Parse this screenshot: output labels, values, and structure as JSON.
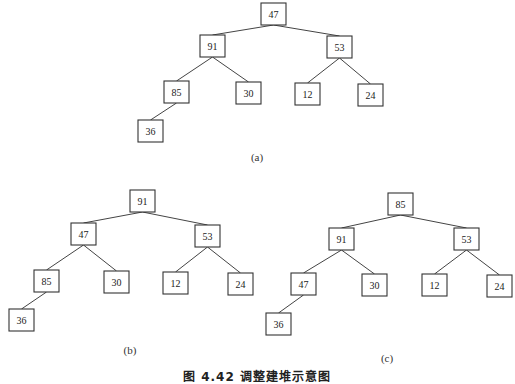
{
  "figure": {
    "caption": "图 4.42  调整建堆示意图",
    "node_size": {
      "width": 25,
      "height": 22
    },
    "trees": [
      {
        "id": "a",
        "label": "(a)",
        "label_pos": {
          "x": 257,
          "y": 151
        },
        "nodes": [
          {
            "id": "a0",
            "value": "47",
            "x": 261,
            "y": 3
          },
          {
            "id": "a1",
            "value": "91",
            "x": 200,
            "y": 35
          },
          {
            "id": "a2",
            "value": "53",
            "x": 327,
            "y": 36
          },
          {
            "id": "a3",
            "value": "85",
            "x": 164,
            "y": 81
          },
          {
            "id": "a4",
            "value": "30",
            "x": 236,
            "y": 82
          },
          {
            "id": "a5",
            "value": "12",
            "x": 295,
            "y": 83
          },
          {
            "id": "a6",
            "value": "24",
            "x": 358,
            "y": 84
          },
          {
            "id": "a7",
            "value": "36",
            "x": 138,
            "y": 120
          }
        ],
        "edges": [
          [
            "a0",
            "a1"
          ],
          [
            "a0",
            "a2"
          ],
          [
            "a1",
            "a3"
          ],
          [
            "a1",
            "a4"
          ],
          [
            "a2",
            "a5"
          ],
          [
            "a2",
            "a6"
          ],
          [
            "a3",
            "a7"
          ]
        ]
      },
      {
        "id": "b",
        "label": "(b)",
        "label_pos": {
          "x": 130,
          "y": 344
        },
        "nodes": [
          {
            "id": "b0",
            "value": "91",
            "x": 130,
            "y": 190
          },
          {
            "id": "b1",
            "value": "47",
            "x": 71,
            "y": 223
          },
          {
            "id": "b2",
            "value": "53",
            "x": 195,
            "y": 225
          },
          {
            "id": "b3",
            "value": "85",
            "x": 34,
            "y": 270
          },
          {
            "id": "b4",
            "value": "30",
            "x": 104,
            "y": 271
          },
          {
            "id": "b5",
            "value": "12",
            "x": 163,
            "y": 272
          },
          {
            "id": "b6",
            "value": "24",
            "x": 228,
            "y": 273
          },
          {
            "id": "b7",
            "value": "36",
            "x": 9,
            "y": 309
          }
        ],
        "edges": [
          [
            "b0",
            "b1"
          ],
          [
            "b0",
            "b2"
          ],
          [
            "b1",
            "b3"
          ],
          [
            "b1",
            "b4"
          ],
          [
            "b2",
            "b5"
          ],
          [
            "b2",
            "b6"
          ],
          [
            "b3",
            "b7"
          ]
        ]
      },
      {
        "id": "c",
        "label": "(c)",
        "label_pos": {
          "x": 387,
          "y": 352
        },
        "nodes": [
          {
            "id": "c0",
            "value": "85",
            "x": 388,
            "y": 193
          },
          {
            "id": "c1",
            "value": "91",
            "x": 329,
            "y": 228
          },
          {
            "id": "c2",
            "value": "53",
            "x": 454,
            "y": 228
          },
          {
            "id": "c3",
            "value": "47",
            "x": 291,
            "y": 273
          },
          {
            "id": "c4",
            "value": "30",
            "x": 362,
            "y": 274
          },
          {
            "id": "c5",
            "value": "12",
            "x": 422,
            "y": 274
          },
          {
            "id": "c6",
            "value": "24",
            "x": 487,
            "y": 275
          },
          {
            "id": "c7",
            "value": "36",
            "x": 266,
            "y": 313
          }
        ],
        "edges": [
          [
            "c0",
            "c1"
          ],
          [
            "c0",
            "c2"
          ],
          [
            "c1",
            "c3"
          ],
          [
            "c1",
            "c4"
          ],
          [
            "c2",
            "c5"
          ],
          [
            "c2",
            "c6"
          ],
          [
            "c3",
            "c7"
          ]
        ]
      }
    ]
  }
}
